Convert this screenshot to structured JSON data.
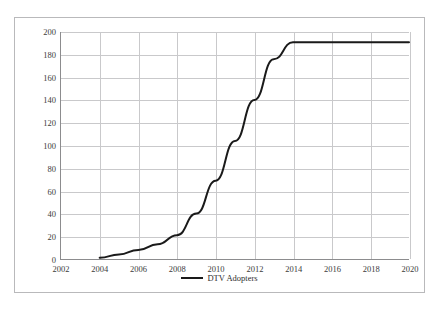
{
  "top_caption": "",
  "bottom_caption": "",
  "legend": {
    "swatch_name": "legend-line-swatch",
    "label": "DTV Adopters"
  },
  "colors": {
    "series_line": "#1a1a1a",
    "gridline": "#c9c9cb",
    "axis": "#8c8c8e",
    "frame": "#b9b9bb",
    "tick_text": "#3b3b3b",
    "background": "#ffffff"
  },
  "chart_data": {
    "type": "line",
    "title": "",
    "xlabel": "",
    "ylabel": "",
    "xlim": [
      2002,
      2020
    ],
    "ylim": [
      0,
      200
    ],
    "ytick_step": 20,
    "xtick_step": 2,
    "grid": true,
    "legend_position": "bottom",
    "yticks": [
      0,
      20,
      40,
      60,
      80,
      100,
      120,
      140,
      160,
      180,
      200
    ],
    "ytick_labels": [
      "0",
      "20",
      "40",
      "60",
      "80",
      "100",
      "120",
      "140",
      "160",
      "180",
      "200"
    ],
    "xticks": [
      2002,
      2004,
      2006,
      2008,
      2010,
      2012,
      2014,
      2016,
      2018,
      2020
    ],
    "xtick_labels": [
      "2002",
      "2004",
      "2006",
      "2008",
      "2010",
      "2012",
      "2014",
      "2016",
      "2018",
      "2020"
    ],
    "series": [
      {
        "name": "DTV Adopters",
        "x": [
          2004,
          2005,
          2006,
          2007,
          2008,
          2009,
          2010,
          2011,
          2012,
          2013,
          2014,
          2015,
          2016,
          2017,
          2018,
          2019,
          2020
        ],
        "values": [
          1,
          4,
          8,
          13,
          21,
          40,
          69,
          104,
          140,
          176,
          191,
          191,
          191,
          191,
          191,
          191,
          191
        ]
      }
    ]
  }
}
